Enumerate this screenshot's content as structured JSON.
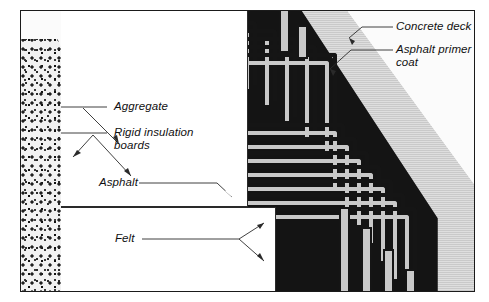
{
  "figure": {
    "type": "technical-cross-section",
    "frame_border_color": "#1a1a1a",
    "background_color": "#ffffff"
  },
  "labels": {
    "aggregate": "Aggregate",
    "rigid_insulation": "Rigid insulation\nboards",
    "asphalt": "Asphalt",
    "felt": "Felt",
    "concrete_deck": "Concrete deck",
    "asphalt_primer": "Asphalt primer\ncoat"
  },
  "materials": [
    {
      "name": "Aggregate",
      "fill": "pebble-stipple",
      "color": "#202020"
    },
    {
      "name": "Rigid insulation boards",
      "fill": "white",
      "color": "#ffffff"
    },
    {
      "name": "Asphalt",
      "fill": "solid-black",
      "color": "#141414"
    },
    {
      "name": "Felt",
      "fill": "light-halftone",
      "color": "#c9c9c9"
    },
    {
      "name": "Asphalt primer coat",
      "fill": "mid-halftone",
      "color": "#cfcfcf"
    },
    {
      "name": "Concrete deck",
      "fill": "fine-stipple",
      "color": "#fbfbfb"
    }
  ],
  "callouts": {
    "left_upper_box": "white",
    "left_lower_box": "white",
    "leader_style": "thin-line-with-arrowhead"
  }
}
